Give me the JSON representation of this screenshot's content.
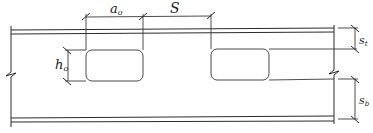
{
  "diagram": {
    "labels": {
      "opening_width": "a",
      "opening_width_sub": "o",
      "spacing": "S",
      "opening_height": "h",
      "opening_height_sub": "o",
      "top_tee_depth": "s",
      "top_tee_depth_sub": "t",
      "bottom_tee_depth": "s",
      "bottom_tee_depth_sub": "b"
    },
    "colors": {
      "line": "#2a2a2a",
      "background": "#ffffff"
    }
  }
}
